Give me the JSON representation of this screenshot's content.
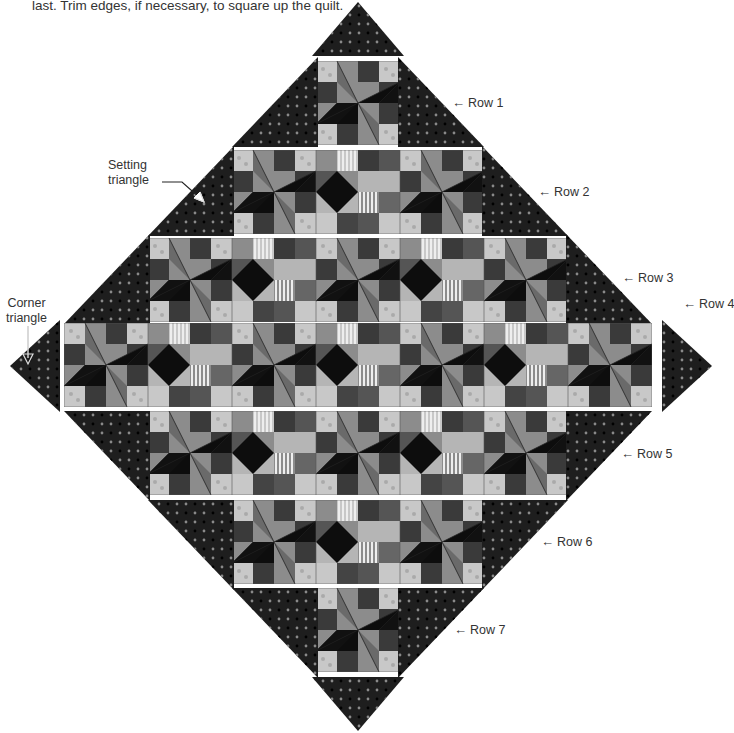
{
  "caption": "last. Trim edges, if necessary, to square up the quilt.",
  "annotations": {
    "setting_triangle": [
      "Setting",
      "triangle"
    ],
    "corner_triangle": [
      "Corner",
      "triangle"
    ]
  },
  "rows": [
    {
      "label": "Row 1",
      "blocks": 1
    },
    {
      "label": "Row 2",
      "blocks": 3
    },
    {
      "label": "Row 3",
      "blocks": 5
    },
    {
      "label": "Row 4",
      "blocks": 7
    },
    {
      "label": "Row 5",
      "blocks": 5
    },
    {
      "label": "Row 6",
      "blocks": 3
    },
    {
      "label": "Row 7",
      "blocks": 1
    }
  ],
  "arrow_glyph": "←",
  "colors": {
    "dark_fabric": "#1e1e1e",
    "dot": "#8a8a8a",
    "light_fabric": "#c8c8c8",
    "mid_fabric": "#8c8c8c",
    "black": "#0d0d0d",
    "medium_dark": "#3a3a3a"
  }
}
